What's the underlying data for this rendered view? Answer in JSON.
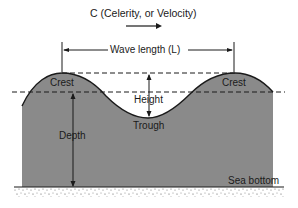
{
  "diagram": {
    "title": "C (Celerity, or Velocity)",
    "labels": {
      "wavelength": "Wave length (L)",
      "crest_left": "Crest",
      "crest_right": "Crest",
      "height": "Height",
      "trough": "Trough",
      "depth": "Depth",
      "sea_bottom": "Sea bottom"
    },
    "colors": {
      "water": "#8a8a8a",
      "line": "#1a1a1a",
      "background": "#ffffff"
    }
  }
}
